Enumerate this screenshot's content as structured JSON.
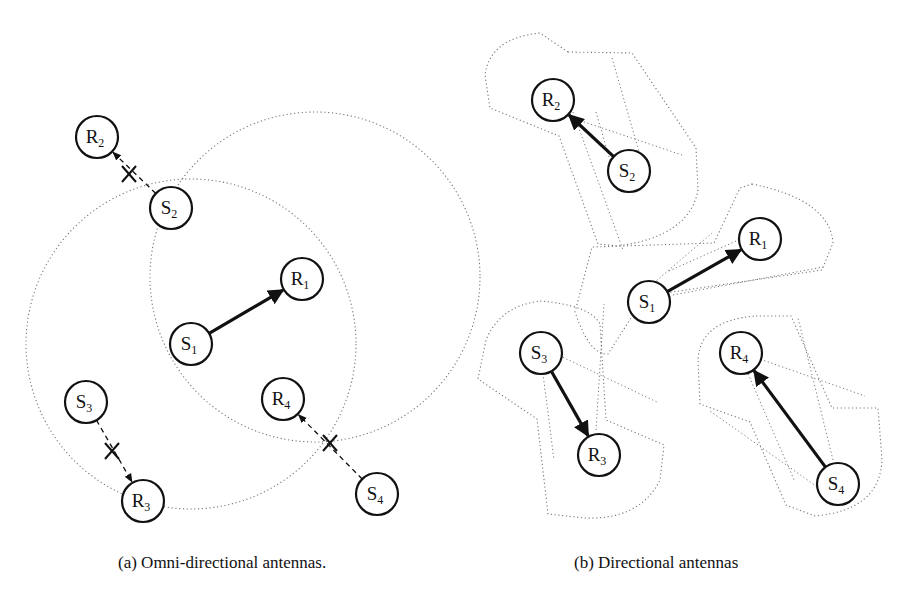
{
  "panels": [
    {
      "id": "a",
      "caption": "(a) Omni-directional antennas.",
      "caption_x": 118,
      "range_circles": [
        {
          "cx": 315,
          "cy": 277,
          "r": 165
        },
        {
          "cx": 191,
          "cy": 344,
          "r": 165
        }
      ],
      "nodes": [
        {
          "id": "R2",
          "letter": "R",
          "sub": "2",
          "x": 97,
          "y": 137
        },
        {
          "id": "S2",
          "letter": "S",
          "sub": "2",
          "x": 171,
          "y": 208
        },
        {
          "id": "R1",
          "letter": "R",
          "sub": "1",
          "x": 302,
          "y": 279
        },
        {
          "id": "S1",
          "letter": "S",
          "sub": "1",
          "x": 191,
          "y": 344
        },
        {
          "id": "S3",
          "letter": "S",
          "sub": "3",
          "x": 86,
          "y": 402
        },
        {
          "id": "R4",
          "letter": "R",
          "sub": "4",
          "x": 283,
          "y": 399
        },
        {
          "id": "R3",
          "letter": "R",
          "sub": "3",
          "x": 143,
          "y": 501
        },
        {
          "id": "S4",
          "letter": "S",
          "sub": "4",
          "x": 377,
          "y": 494
        }
      ],
      "links": [
        {
          "from": "S1",
          "to": "R1",
          "style": "solid",
          "blocked": false
        },
        {
          "from": "S2",
          "to": "R2",
          "style": "dashed",
          "blocked": true,
          "x_mark": [
            129,
            174
          ]
        },
        {
          "from": "S3",
          "to": "R3",
          "style": "dashed",
          "blocked": true,
          "x_mark": [
            112,
            451
          ]
        },
        {
          "from": "S4",
          "to": "R4",
          "style": "dashed",
          "blocked": true,
          "x_mark": [
            330,
            443
          ]
        }
      ]
    },
    {
      "id": "b",
      "caption": "(b) Directional antennas",
      "caption_x": 574,
      "beams": [
        {
          "pair": "S2-R2",
          "path": "M 568 52 L 632 53 L 696 148 L 698 190 Q 690 236 618 246 L 598 244 L 559 136 L 490 108 L 485 75 Q 490 38 540 33 Z"
        },
        {
          "pair": "S1-R1",
          "path": "M 752 184 Q 830 200 833 243 L 822 270 L 645 296 L 608 354 Q 590 356 575 312 L 592 247 L 714 243 L 740 188 Z"
        },
        {
          "pair": "S3-R3",
          "path": "M 540 301 Q 590 305 600 324 L 606 420 L 664 445 L 660 480 Q 640 520 585 518 L 548 514 L 537 419 L 478 379 L 486 340 Q 500 306 540 301 Z"
        },
        {
          "pair": "S4-R4",
          "path": "M 756 316 L 791 316 L 832 408 L 878 408 L 882 460 Q 880 510 815 516 L 786 505 L 750 422 L 700 404 L 698 360 Q 700 320 756 316 Z"
        }
      ],
      "beam_axes": [
        {
          "from": [
            537,
            106
          ],
          "to": [
            682,
            155
          ]
        },
        {
          "from": [
            596,
            112
          ],
          "to": [
            616,
            181
          ]
        },
        {
          "from": [
            612,
            58
          ],
          "to": [
            646,
            176
          ]
        },
        {
          "from": [
            573,
            112
          ],
          "to": [
            623,
            250
          ]
        },
        {
          "from": [
            669,
            271
          ],
          "to": [
            752,
            234
          ]
        },
        {
          "from": [
            673,
            295
          ],
          "to": [
            823,
            267
          ]
        },
        {
          "from": [
            648,
            288
          ],
          "to": [
            712,
            233
          ]
        },
        {
          "from": [
            556,
            354
          ],
          "to": [
            657,
            402
          ]
        },
        {
          "from": [
            542,
            366
          ],
          "to": [
            554,
            460
          ]
        },
        {
          "from": [
            596,
            430
          ],
          "to": [
            604,
            304
          ]
        },
        {
          "from": [
            757,
            358
          ],
          "to": [
            865,
            396
          ]
        },
        {
          "from": [
            745,
            367
          ],
          "to": [
            795,
            482
          ]
        },
        {
          "from": [
            823,
            491
          ],
          "to": [
            710,
            411
          ]
        },
        {
          "from": [
            833,
            460
          ],
          "to": [
            798,
            318
          ]
        }
      ],
      "nodes": [
        {
          "id": "R2",
          "letter": "R",
          "sub": "2",
          "x": 553,
          "y": 100
        },
        {
          "id": "S2",
          "letter": "S",
          "sub": "2",
          "x": 629,
          "y": 171
        },
        {
          "id": "R1",
          "letter": "R",
          "sub": "1",
          "x": 760,
          "y": 239
        },
        {
          "id": "S1",
          "letter": "S",
          "sub": "1",
          "x": 649,
          "y": 302
        },
        {
          "id": "S3",
          "letter": "S",
          "sub": "3",
          "x": 541,
          "y": 353
        },
        {
          "id": "R3",
          "letter": "R",
          "sub": "3",
          "x": 599,
          "y": 455
        },
        {
          "id": "R4",
          "letter": "R",
          "sub": "4",
          "x": 741,
          "y": 353
        },
        {
          "id": "S4",
          "letter": "S",
          "sub": "4",
          "x": 838,
          "y": 484
        }
      ],
      "links": [
        {
          "from": "S2",
          "to": "R2",
          "style": "solid",
          "blocked": false
        },
        {
          "from": "S1",
          "to": "R1",
          "style": "solid",
          "blocked": false
        },
        {
          "from": "S3",
          "to": "R3",
          "style": "solid",
          "blocked": false
        },
        {
          "from": "S4",
          "to": "R4",
          "style": "solid",
          "blocked": false
        }
      ]
    }
  ],
  "style": {
    "node_radius": 21,
    "stroke_color": "#111111",
    "range_color": "#777777",
    "background": "#ffffff"
  }
}
